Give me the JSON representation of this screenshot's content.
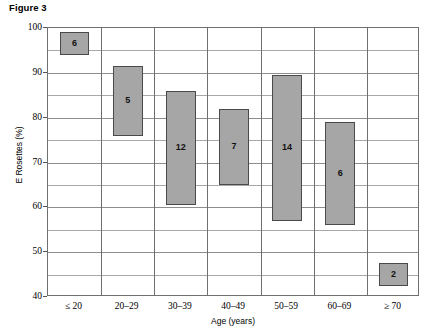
{
  "figure": {
    "caption": "Figure 3"
  },
  "axes": {
    "y_title": "E Rosettes (%)",
    "x_title": "Age (years)",
    "y_ticks": [
      "100",
      "90",
      "80",
      "70",
      "60",
      "50",
      "40"
    ],
    "x_ticks": [
      "≤ 20",
      "20–29",
      "30–39",
      "40–49",
      "50–59",
      "60–69",
      "≥ 70"
    ]
  },
  "style": {
    "box_fill": "#a6a6a6",
    "box_stroke": "#4a4a4a",
    "grid_major": "#8d8d8d",
    "grid_minor": "#a8a8a8",
    "axis_color": "#6f6f6f"
  },
  "chart_data": {
    "type": "bar",
    "title": "Figure 3",
    "xlabel": "Age (years)",
    "ylabel": "E Rosettes (%)",
    "ylim": [
      40,
      100
    ],
    "yticks": [
      40,
      50,
      60,
      70,
      80,
      90,
      100
    ],
    "y_minor_ticks": [
      45,
      55,
      65,
      75,
      85,
      95
    ],
    "grid": true,
    "legend": "none",
    "categories": [
      "≤ 20",
      "20–29",
      "30–39",
      "40–49",
      "50–59",
      "60–69",
      "≥ 70"
    ],
    "bars": [
      {
        "category": "≤ 20",
        "low": 94.0,
        "high": 99.0,
        "label": "6",
        "n": 6
      },
      {
        "category": "20–29",
        "low": 76.0,
        "high": 91.5,
        "label": "5",
        "n": 5
      },
      {
        "category": "30–39",
        "low": 60.5,
        "high": 86.0,
        "label": "12",
        "n": 12
      },
      {
        "category": "40–49",
        "low": 65.0,
        "high": 82.0,
        "label": "7",
        "n": 7
      },
      {
        "category": "50–59",
        "low": 57.0,
        "high": 89.5,
        "label": "14",
        "n": 14
      },
      {
        "category": "60–69",
        "low": 56.0,
        "high": 79.0,
        "label": "6",
        "n": 6
      },
      {
        "category": "≥ 70",
        "low": 42.5,
        "high": 47.5,
        "label": "2",
        "n": 2
      }
    ]
  }
}
